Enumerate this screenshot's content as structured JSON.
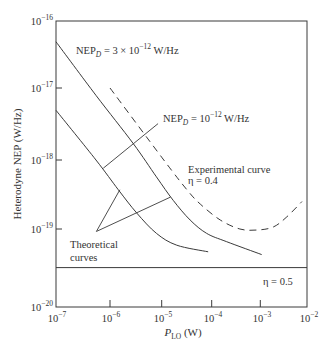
{
  "chart_data": {
    "type": "line",
    "title": "",
    "xlabel": "P_LO (W)",
    "ylabel": "Heterodyne NEP (W/Hz)",
    "xscale": "log",
    "yscale": "log",
    "xlim": [
      1e-07,
      0.01
    ],
    "ylim": [
      1e-20,
      1e-16
    ],
    "grid": false,
    "legend": null,
    "xticks": [
      {
        "value": 1e-07,
        "base": "10",
        "exp": "−7"
      },
      {
        "value": 1e-06,
        "base": "10",
        "exp": "−6"
      },
      {
        "value": 1e-05,
        "base": "10",
        "exp": "−5"
      },
      {
        "value": 0.0001,
        "base": "10",
        "exp": "−4"
      },
      {
        "value": 0.001,
        "base": "10",
        "exp": "−3"
      },
      {
        "value": 0.01,
        "base": "10",
        "exp": "−2"
      }
    ],
    "yticks": [
      {
        "value": 1e-16,
        "base": "10",
        "exp": "−16"
      },
      {
        "value": 1e-17,
        "base": "10",
        "exp": "−17"
      },
      {
        "value": 1e-18,
        "base": "10",
        "exp": "−18"
      },
      {
        "value": 1e-19,
        "base": "10",
        "exp": "−19"
      },
      {
        "value": 1e-20,
        "base": "10",
        "exp": "−20"
      }
    ],
    "series": [
      {
        "name": "Theoretical curve, NEP_D = 3 × 10^-12 W/Hz",
        "style": "solid",
        "points": [
          [
            1e-07,
            4.9e-17
          ],
          [
            5.5e-07,
            7.9e-18
          ],
          [
            2.8e-06,
            1.7e-18
          ],
          [
            7.9e-06,
            5.7e-19
          ],
          [
            1.7e-05,
            2.6e-19
          ],
          [
            3.7e-05,
            1.35e-19
          ],
          [
            7.9e-05,
            8.8e-20
          ],
          [
            0.0002,
            6.9e-20
          ],
          [
            0.00107,
            4.7e-20
          ]
        ]
      },
      {
        "name": "Theoretical curve, NEP_D = 10^-12 W/Hz",
        "style": "solid",
        "points": [
          [
            1e-07,
            4.9e-18
          ],
          [
            5.5e-07,
            1e-18
          ],
          [
            1.45e-06,
            3.7e-19
          ],
          [
            3.3e-06,
            1.7e-19
          ],
          [
            7.9e-06,
            8.8e-20
          ],
          [
            2e-05,
            6.2e-20
          ],
          [
            8.5e-05,
            5.1e-20
          ]
        ]
      },
      {
        "name": "Experimental curve, η = 0.4",
        "style": "dashed",
        "points": [
          [
            1e-06,
            1e-17
          ],
          [
            1.1e-05,
            1e-18
          ],
          [
            3.2e-05,
            3.7e-19
          ],
          [
            5.9e-05,
            2.3e-19
          ],
          [
            0.00015,
            1.35e-19
          ],
          [
            0.00038,
            1e-19
          ],
          [
            0.00085,
            9.7e-20
          ],
          [
            0.0019,
            1.07e-19
          ],
          [
            0.0037,
            1.5e-19
          ],
          [
            0.0078,
            2.5e-19
          ]
        ]
      },
      {
        "name": "η = 0.5",
        "style": "solid",
        "smooth": false,
        "points": [
          [
            1e-07,
            3.2e-20
          ],
          [
            0.01,
            3.2e-20
          ]
        ]
      }
    ],
    "annotations": [
      {
        "name": "nep-1e-12-leader",
        "from": [
          7.5e-07,
          7.6e-19
        ],
        "to": [
          8.5e-06,
          3.2e-18
        ]
      },
      {
        "name": "theoretical-leader-lower",
        "from": [
          5.6e-07,
          9.3e-20
        ],
        "to": [
          1.55e-06,
          3.7e-19
        ]
      },
      {
        "name": "theoretical-leader-upper",
        "from": [
          5.6e-07,
          9.3e-20
        ],
        "to": [
          1.5e-05,
          2.9e-19
        ]
      }
    ]
  },
  "labels": {
    "nep3": {
      "main": "NEP",
      "sub": "D",
      "mid": " = 3 × 10",
      "sup": "−12",
      "tail": " W/Hz"
    },
    "nep1": {
      "main": "NEP",
      "sub": "D",
      "mid": " = 10",
      "sup": "−12",
      "tail": " W/Hz"
    },
    "experimental": {
      "line1": "Experimental curve",
      "line2": "η = 0.4"
    },
    "theoretical": {
      "line1": "Theoretical",
      "line2": "curves"
    },
    "eta05": "η = 0.5",
    "xlabel": {
      "main": "P",
      "sub": "LO",
      "tail": " (W)"
    },
    "ylabel": "Heterodyne NEP (W/Hz)"
  }
}
